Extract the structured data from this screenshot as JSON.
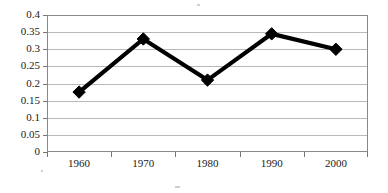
{
  "chart_data": {
    "type": "line",
    "title": "",
    "subtitle": "",
    "xlabel": "",
    "ylabel": "",
    "categories": [
      "1960",
      "1970",
      "1980",
      "1990",
      "2000"
    ],
    "values": [
      0.175,
      0.33,
      0.21,
      0.345,
      0.3
    ],
    "series": [
      {
        "name": "Series 1",
        "values": [
          0.175,
          0.33,
          0.21,
          0.345,
          0.3
        ]
      }
    ],
    "ylim": [
      0,
      0.4
    ],
    "ytick_labels": [
      "0",
      "0.05",
      "0.1",
      "0.15",
      "0.2",
      "0.25",
      "0.3",
      "0.35",
      "0.4"
    ],
    "ytick_values": [
      0,
      0.05,
      0.1,
      0.15,
      0.2,
      0.25,
      0.3,
      0.35,
      0.4
    ],
    "grid": true,
    "grid_axis": "y",
    "legend": false,
    "legend_position": "none",
    "marker": "diamond",
    "line_color": "#000000",
    "marker_color": "#000000",
    "grid_color": "#b9b9b9",
    "plot_border_color": "#888888",
    "plot_background": "#ffffff",
    "annotations": []
  }
}
